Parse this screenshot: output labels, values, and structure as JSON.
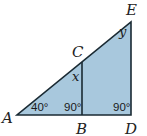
{
  "diagram": {
    "fill_color": "#a8c8dd",
    "stroke_color": "#1a2a33",
    "points": {
      "A": {
        "label": "A",
        "x": 17,
        "y": 115
      },
      "B": {
        "label": "B",
        "x": 82,
        "y": 115
      },
      "C": {
        "label": "C",
        "x": 82,
        "y": 62
      },
      "D": {
        "label": "D",
        "x": 131,
        "y": 115
      },
      "E": {
        "label": "E",
        "x": 131,
        "y": 22
      }
    },
    "segments": [
      "AD",
      "DE",
      "EA",
      "BC"
    ],
    "angles": {
      "A": "40°",
      "B": "90°",
      "D": "90°",
      "C_interior": "x",
      "E_interior": "y"
    }
  }
}
